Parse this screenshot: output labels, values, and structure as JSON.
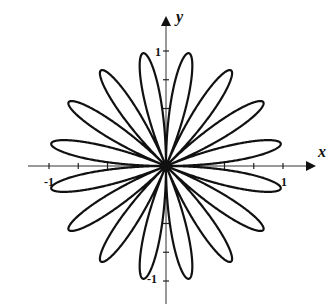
{
  "chart_data": {
    "type": "line",
    "subtype": "polar-rose",
    "equation": "r = sin(8θ)",
    "petals": 16,
    "title": "",
    "xlabel": "x",
    "ylabel": "y",
    "xlim": [
      -1.2,
      1.2
    ],
    "ylim": [
      -1.2,
      1.2
    ],
    "x_tick_labels": [
      {
        "value": -1,
        "label": "-1"
      },
      {
        "value": 1,
        "label": "1"
      }
    ],
    "y_tick_labels": [
      {
        "value": 1,
        "label": "1"
      },
      {
        "value": -1,
        "label": "-1"
      }
    ],
    "tick_values": [
      -1,
      -0.75,
      -0.5,
      0.5,
      0.75,
      1
    ],
    "petal_angles_deg": [
      11.25,
      33.75,
      56.25,
      78.75,
      101.25,
      123.75,
      146.25,
      168.75,
      191.25,
      213.75,
      236.25,
      258.75,
      281.25,
      303.75,
      326.25,
      348.75
    ],
    "grid": false,
    "legend": null,
    "line_color": "#111111"
  },
  "axes": {
    "x_label": "x",
    "y_label": "y",
    "x_neg_label": "-1",
    "x_pos_label": "1",
    "y_pos_label": "1",
    "y_neg_label": "-1"
  }
}
